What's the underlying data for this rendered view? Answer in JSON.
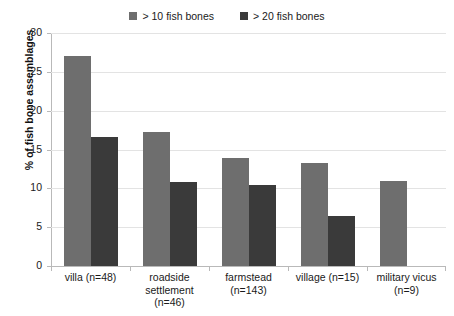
{
  "chart_data": {
    "type": "bar",
    "title": "",
    "subtitle": "",
    "xlabel": "",
    "ylabel": "% of fish bone assemblages",
    "ylim": [
      0,
      30
    ],
    "ytick_step": 5,
    "yticks": [
      "30",
      "25",
      "20",
      "15",
      "10",
      "5",
      "0"
    ],
    "ytick_values": [
      30,
      25,
      20,
      15,
      10,
      5,
      0
    ],
    "grid": "horizontal",
    "legend_position": "top-center",
    "categories": [
      "villa (n=48)",
      "roadside settlement (n=46)",
      "farmstead (n=143)",
      "village (n=15)",
      "military vicus (n=9)"
    ],
    "category_lines": [
      [
        "villa (n=48)"
      ],
      [
        "roadside",
        "settlement",
        "(n=46)"
      ],
      [
        "farmstead",
        "(n=143)"
      ],
      [
        "village (n=15)"
      ],
      [
        "military vicus",
        "(n=9)"
      ]
    ],
    "series": [
      {
        "name": "> 10 fish bones",
        "color": "#6e6e6e",
        "values": [
          27.1,
          17.3,
          13.9,
          13.2,
          11.0
        ]
      },
      {
        "name": "> 20 fish bones",
        "color": "#3a3a3a",
        "values": [
          16.6,
          10.8,
          10.4,
          6.5,
          null
        ]
      }
    ]
  },
  "legend": {
    "entries": [
      {
        "label": "> 10 fish bones",
        "color": "#6e6e6e",
        "swatch_icon": "square-swatch-icon"
      },
      {
        "label": "> 20 fish bones",
        "color": "#3a3a3a",
        "swatch_icon": "square-swatch-icon"
      }
    ]
  },
  "axes": {
    "y_title": "% of fish bone assemblages",
    "y_tick_labels": [
      "30",
      "25",
      "20",
      "15",
      "10",
      "5",
      "0"
    ]
  },
  "colors": {
    "series_light": "#6e6e6e",
    "series_dark": "#3a3a3a",
    "gridline": "#e3e3e3",
    "axis": "#b9b9b9",
    "text": "#1a1a1a",
    "background": "#ffffff"
  }
}
